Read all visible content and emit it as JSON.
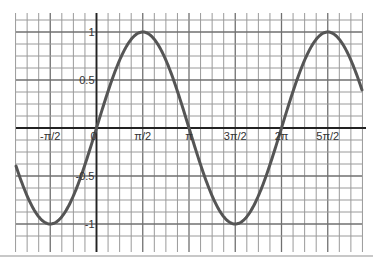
{
  "chart_data": {
    "type": "line",
    "title": "",
    "xlabel": "",
    "ylabel": "",
    "function": "y = sin(x)",
    "series": [
      {
        "name": "sin(x)",
        "color": "#555555",
        "x": [
          -2.72,
          -2.356,
          -1.571,
          -0.785,
          0,
          0.785,
          1.571,
          2.356,
          3.142,
          3.927,
          4.712,
          5.498,
          6.283,
          7.069,
          7.854,
          8.639,
          9.03
        ],
        "values": [
          -0.41,
          -0.707,
          -1,
          -0.707,
          0,
          0.707,
          1,
          0.707,
          0,
          -0.707,
          -1,
          -0.707,
          0,
          0.707,
          1,
          0.707,
          0.38
        ]
      }
    ],
    "x_ticks": [
      {
        "label": "-π/2",
        "value": -1.5708
      },
      {
        "label": "0",
        "value": 0
      },
      {
        "label": "π/2",
        "value": 1.5708
      },
      {
        "label": "π",
        "value": 3.1416
      },
      {
        "label": "3π/2",
        "value": 4.7124
      },
      {
        "label": "2π",
        "value": 6.2832
      },
      {
        "label": "5π/2",
        "value": 7.854
      }
    ],
    "y_ticks": [
      {
        "label": "1",
        "value": 1
      },
      {
        "label": "0.5",
        "value": 0.5
      },
      {
        "label": "-0.5",
        "value": -0.5
      },
      {
        "label": "-1",
        "value": -1
      }
    ],
    "xlim": [
      -2.72,
      9.03
    ],
    "ylim": [
      -1.25,
      1.125
    ],
    "grid": true,
    "grid_step_x": "π/8",
    "grid_step_y": 0.125,
    "legend": null
  }
}
